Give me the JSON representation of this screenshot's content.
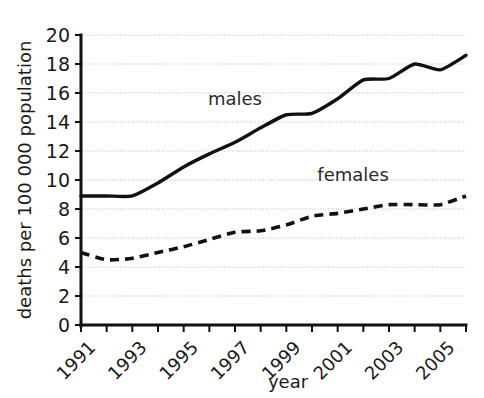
{
  "chart_data": {
    "type": "line",
    "title": "",
    "xlabel": "year",
    "ylabel": "deaths per 100 000 population",
    "x": [
      1991,
      1992,
      1993,
      1994,
      1995,
      1996,
      1997,
      1998,
      1999,
      2000,
      2001,
      2002,
      2003,
      2004,
      2005,
      2006
    ],
    "xlim": [
      1991,
      2006
    ],
    "ylim": [
      0,
      20
    ],
    "ytick_values": [
      0,
      2,
      4,
      6,
      8,
      10,
      12,
      14,
      16,
      18,
      20
    ],
    "ytick_labels": [
      "0",
      "2",
      "4",
      "6",
      "8",
      "10",
      "12",
      "14",
      "16",
      "18",
      "20"
    ],
    "xtick_values": [
      1991,
      1992,
      1993,
      1994,
      1995,
      1996,
      1997,
      1998,
      1999,
      2000,
      2001,
      2002,
      2003,
      2004,
      2005,
      2006
    ],
    "xtick_labels": [
      "1991",
      "",
      "1993",
      "",
      "1995",
      "",
      "1997",
      "",
      "1999",
      "",
      "2001",
      "",
      "2003",
      "",
      "2005",
      ""
    ],
    "grid": true,
    "grid_axis": "y",
    "legend_position": "inline-annotations",
    "series": [
      {
        "name": "males",
        "style": "solid",
        "color": "#111111",
        "label_text": "males",
        "values": [
          8.9,
          8.9,
          8.9,
          9.8,
          10.9,
          11.8,
          12.6,
          13.6,
          14.5,
          14.6,
          15.6,
          16.9,
          17.0,
          18.0,
          17.6,
          18.6
        ]
      },
      {
        "name": "females",
        "style": "dashed",
        "color": "#111111",
        "label_text": "females",
        "values": [
          5.0,
          4.5,
          4.6,
          5.0,
          5.4,
          5.9,
          6.4,
          6.5,
          6.9,
          7.5,
          7.7,
          8.0,
          8.3,
          8.3,
          8.3,
          8.9
        ]
      }
    ],
    "annotations": [
      {
        "text": "males",
        "x": 1997.0,
        "y": 15.2
      },
      {
        "text": "females",
        "x": 2001.6,
        "y": 9.9
      }
    ]
  }
}
